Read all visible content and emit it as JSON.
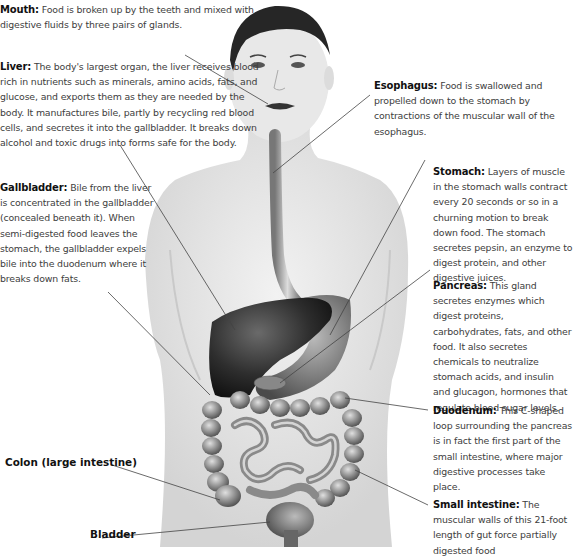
{
  "figure": {
    "colors": {
      "background": "#ffffff",
      "skin": "#e6e6e6",
      "organ_dark": "#2c2c2c",
      "intestine": "#9a9a9a",
      "leader_line": "#444444",
      "label_text": "#111111",
      "body_text": "#404040"
    }
  },
  "labels": {
    "mouth": {
      "name": "Mouth:",
      "text": "Food is broken up by the teeth and mixed with digestive fluids by three pairs of glands."
    },
    "liver": {
      "name": "Liver:",
      "text": "The body's largest organ, the liver receives blood rich in nutrients such as minerals, amino acids, fats, and glucose, and exports them as they are needed by the body. It manufactures bile, partly by recycling red blood cells, and secretes it into the gallbladder. It breaks down alcohol and toxic drugs into forms safe for the body."
    },
    "gallbladder": {
      "name": "Gallbladder:",
      "text": "Bile from the liver is concentrated in the gallbladder (concealed beneath it). When semi-digested food leaves the stomach, the gallbladder expels bile into the duodenum where it breaks down fats."
    },
    "esophagus": {
      "name": "Esophagus:",
      "text": "Food is swallowed and propelled down to the stomach by contractions of the muscular wall of the esophagus."
    },
    "stomach": {
      "name": "Stomach:",
      "text": "Layers of muscle in the stomach walls contract every 20 seconds or so in a churning motion to break down food. The stomach secretes pepsin, an enzyme to digest protein, and other digestive juices."
    },
    "pancreas": {
      "name": "Pancreas:",
      "text": "This gland secretes enzymes which digest proteins, carbohydrates, fats, and other food. It also secretes chemicals to neutralize stomach acids, and insulin and glucagon, hormones that regulate blood sugar levels."
    },
    "duodenum": {
      "name": "Duodenum:",
      "text": "This C-shaped loop surrounding the pancreas is in fact the first part of the small intestine, where major digestive processes take place."
    },
    "small_intestine": {
      "name": "Small intestine:",
      "text": "The muscular walls of this 21-foot length of gut force partially digested food"
    },
    "colon": {
      "name": "Colon (large intestine)"
    },
    "bladder": {
      "name": "Bladder"
    }
  }
}
